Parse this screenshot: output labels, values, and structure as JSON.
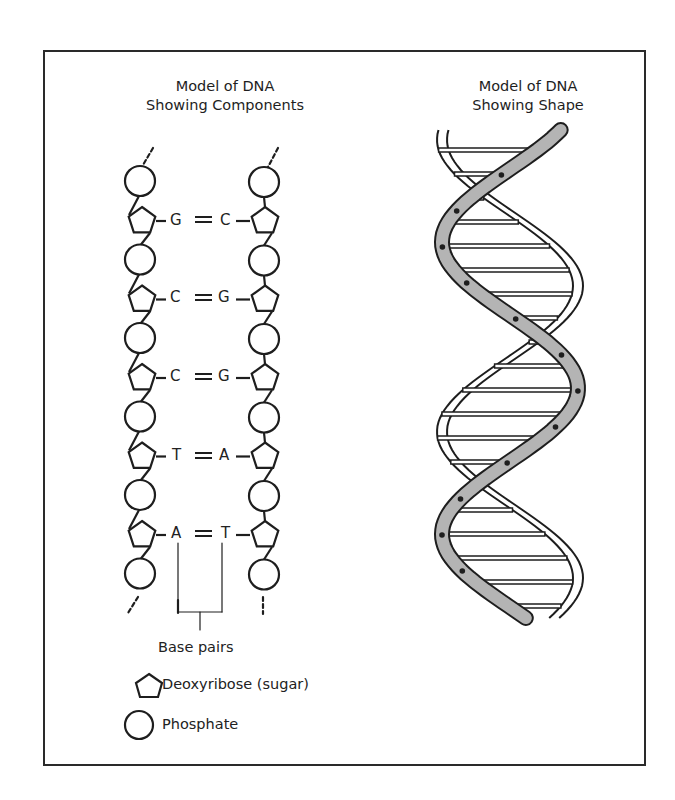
{
  "left_panel": {
    "title_line1": "Model of DNA",
    "title_line2": "Showing Components",
    "base_pairs": [
      {
        "left": "G",
        "right": "C"
      },
      {
        "left": "C",
        "right": "G"
      },
      {
        "left": "C",
        "right": "G"
      },
      {
        "left": "T",
        "right": "A"
      },
      {
        "left": "A",
        "right": "T"
      }
    ],
    "bracket_label": "Base pairs"
  },
  "right_panel": {
    "title_line1": "Model of DNA",
    "title_line2": "Showing Shape"
  },
  "legend": {
    "items": [
      {
        "icon": "pentagon-icon",
        "label": "Deoxyribose (sugar)"
      },
      {
        "icon": "circle-icon",
        "label": "Phosphate"
      }
    ]
  },
  "colors": {
    "line": "#1e1e1e",
    "ribbon_fill": "#b4b4b4",
    "background": "#ffffff"
  }
}
